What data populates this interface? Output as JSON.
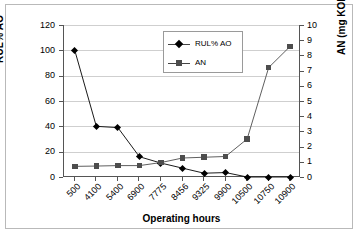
{
  "chart_data": {
    "type": "line",
    "title": "",
    "xlabel": "Operating hours",
    "ylabel": "RUL% AO",
    "y2label": "AN (mg KOH/g oil)",
    "categories": [
      "500",
      "4100",
      "5400",
      "6900",
      "7775",
      "8456",
      "9325",
      "9900",
      "10500",
      "10750",
      "10900"
    ],
    "ylim": [
      0,
      120
    ],
    "yticks": [
      "0",
      "20",
      "40",
      "60",
      "80",
      "100",
      "120"
    ],
    "y2lim": [
      0,
      10
    ],
    "y2ticks": [
      "0",
      "1",
      "2",
      "3",
      "4",
      "5",
      "6",
      "7",
      "8",
      "9",
      "10"
    ],
    "grid": true,
    "legend_position": "top-center-inside",
    "series": [
      {
        "name": "RUL% AO",
        "axis": "left",
        "marker": "diamond",
        "color": "#000000",
        "values": [
          100,
          40,
          39,
          16,
          11,
          7,
          3,
          3.5,
          0,
          0,
          0
        ]
      },
      {
        "name": "AN",
        "axis": "right",
        "marker": "square",
        "color": "#4d4d4d",
        "values": [
          0.7,
          0.72,
          0.75,
          0.75,
          0.95,
          1.25,
          1.3,
          1.35,
          2.5,
          7.2,
          8.6
        ]
      }
    ]
  }
}
